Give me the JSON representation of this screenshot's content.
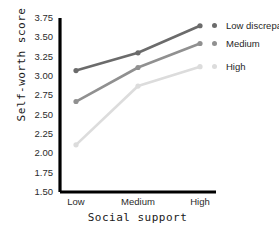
{
  "chart_data": {
    "type": "line",
    "title": "",
    "xlabel": "Social support",
    "ylabel": "Self-worth score",
    "categories": [
      "Low",
      "Medium",
      "High"
    ],
    "ylim": [
      1.5,
      3.75
    ],
    "yticks": [
      "3.75",
      "3.50",
      "3.25",
      "3.00",
      "2.75",
      "2.50",
      "2.25",
      "2.00",
      "1.75",
      "1.50"
    ],
    "ytick_values": [
      3.75,
      3.5,
      3.25,
      3.0,
      2.75,
      2.5,
      2.25,
      2.0,
      1.75,
      1.5
    ],
    "grid": false,
    "legend_position": "right-inline",
    "series": [
      {
        "name": "Low discrepancy",
        "values": [
          3.07,
          3.3,
          3.65
        ],
        "color": "#6b6b6b"
      },
      {
        "name": "Medium",
        "values": [
          2.67,
          3.11,
          3.42
        ],
        "color": "#909090"
      },
      {
        "name": "High",
        "values": [
          2.11,
          2.87,
          3.12
        ],
        "color": "#dcdcdc"
      }
    ]
  },
  "axis": {
    "line_color": "#000000"
  }
}
